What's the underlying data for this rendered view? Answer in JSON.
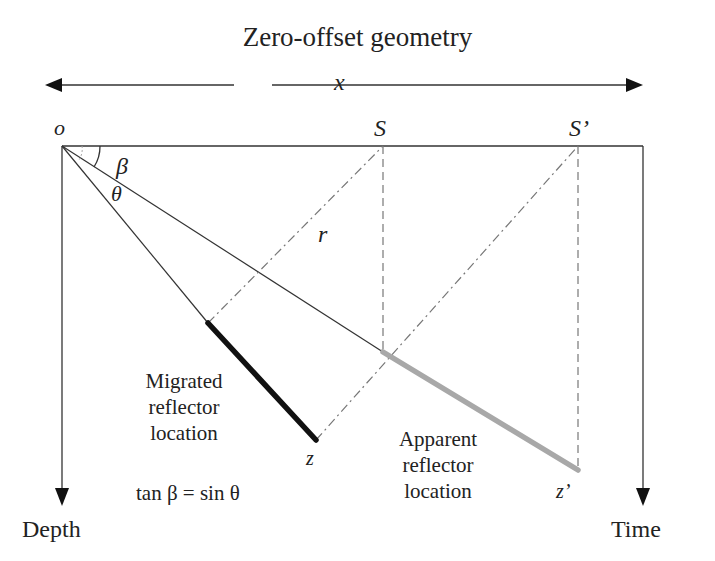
{
  "title": "Zero-offset geometry",
  "labels": {
    "x": "x",
    "origin": "o",
    "S": "S",
    "S_prime": "S’",
    "beta": "β",
    "theta": "θ",
    "r": "r",
    "z": "z",
    "z_prime": "z’",
    "migrated": [
      "Migrated",
      "reflector",
      "location"
    ],
    "apparent": [
      "Apparent",
      "reflector",
      "location"
    ],
    "equation": "tan β = sin θ",
    "depth_axis": "Depth",
    "time_axis": "Time"
  },
  "colors": {
    "line": "#2a2a2a",
    "migrated_reflector": "#111111",
    "apparent_reflector": "#a8a8a8",
    "construction": "#777777"
  }
}
